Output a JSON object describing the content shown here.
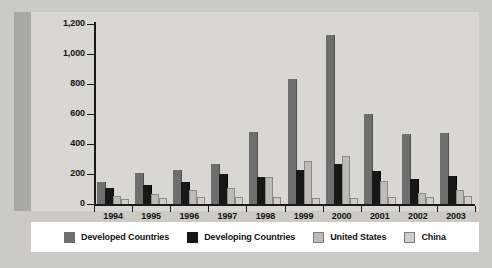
{
  "chart_data": {
    "type": "bar",
    "title": "",
    "xlabel": "",
    "ylabel": "",
    "ylim": [
      0,
      1200
    ],
    "yticks": [
      0,
      200,
      400,
      600,
      800,
      1000,
      1200
    ],
    "ytick_labels": [
      "0",
      "200",
      "400",
      "600",
      "800",
      "1,000",
      "1,200"
    ],
    "grid": false,
    "legend_position": "bottom",
    "categories": [
      "1994",
      "1995",
      "1996",
      "1997",
      "1998",
      "1999",
      "2000",
      "2001",
      "2002",
      "2003"
    ],
    "series": [
      {
        "name": "Developed Countries",
        "color": "#6e6e6e",
        "values": [
          145,
          210,
          225,
          265,
          480,
          835,
          1125,
          600,
          465,
          475
        ]
      },
      {
        "name": "Developing Countries",
        "color": "#171717",
        "values": [
          110,
          125,
          150,
          200,
          180,
          230,
          265,
          220,
          165,
          190
        ]
      },
      {
        "name": "United States",
        "color": "#bdbbb7",
        "values": [
          55,
          65,
          95,
          110,
          180,
          290,
          320,
          155,
          75,
          95
        ]
      },
      {
        "name": "China",
        "color": "#cfcdc9",
        "values": [
          35,
          40,
          45,
          50,
          45,
          40,
          40,
          45,
          50,
          55
        ]
      }
    ]
  },
  "legend": {
    "items": [
      {
        "label": "Developed Countries",
        "swatch": "developed-countries-swatch"
      },
      {
        "label": "Developing Countries",
        "swatch": "developing-countries-swatch"
      },
      {
        "label": "United States",
        "swatch": "united-states-swatch"
      },
      {
        "label": "China",
        "swatch": "china-swatch"
      }
    ]
  }
}
